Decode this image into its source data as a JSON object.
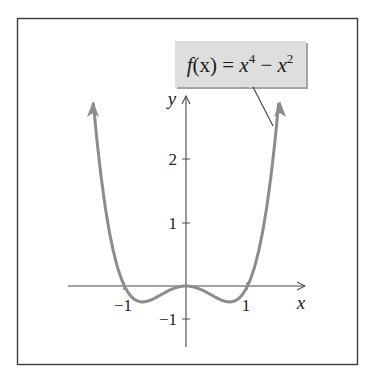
{
  "chart_data": {
    "type": "line",
    "title": "",
    "function_label": {
      "f": "f",
      "x_arg": "(x)",
      "eq": " = ",
      "base1": "x",
      "exp1": "4",
      "minus": " − ",
      "base2": "x",
      "exp2": "2"
    },
    "expression": "f(x) = x^4 - x^2",
    "xlabel": "x",
    "ylabel": "y",
    "x_ticks": [
      {
        "value": -1,
        "label": "−1"
      },
      {
        "value": 1,
        "label": "1"
      }
    ],
    "y_ticks": [
      {
        "value": -1,
        "label": "−1"
      },
      {
        "value": 1,
        "label": "1"
      },
      {
        "value": 2,
        "label": "2"
      }
    ],
    "xlim": [
      -1.95,
      1.95
    ],
    "ylim": [
      -1.5,
      3.0
    ],
    "grid": false,
    "legend": "callout box, top-right",
    "series": [
      {
        "name": "f(x) = x^4 - x^2",
        "x": [
          -1.52,
          -1.4,
          -1.2,
          -1.0,
          -0.8,
          -0.707,
          -0.6,
          -0.4,
          -0.2,
          0,
          0.2,
          0.4,
          0.6,
          0.707,
          0.8,
          1.0,
          1.2,
          1.4,
          1.52
        ],
        "values": [
          2.83,
          1.88,
          0.63,
          0,
          -0.23,
          -0.25,
          -0.23,
          -0.13,
          -0.04,
          0,
          -0.04,
          -0.13,
          -0.23,
          -0.25,
          -0.23,
          0,
          0.63,
          1.88,
          2.83
        ]
      }
    ],
    "colors": {
      "curve": "#8c8c8c",
      "axes": "#4a4a4a",
      "callout_fill": "#dedede",
      "frame": "#3a3a3a"
    }
  }
}
